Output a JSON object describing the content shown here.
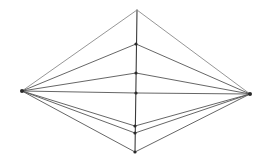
{
  "diagram": {
    "type": "perspective-construction",
    "vanishing_points": {
      "left": {
        "x": 22,
        "y": 91
      },
      "right": {
        "x": 250,
        "y": 94
      }
    },
    "vertical_line": {
      "points": [
        {
          "id": "top",
          "x": 137,
          "y": 10,
          "dot": false
        },
        {
          "id": "p2",
          "x": 136,
          "y": 44,
          "dot": true
        },
        {
          "id": "p3",
          "x": 136,
          "y": 73,
          "dot": true
        },
        {
          "id": "center",
          "x": 136,
          "y": 93,
          "dot": true
        },
        {
          "id": "p5",
          "x": 135,
          "y": 126,
          "dot": true
        },
        {
          "id": "p6",
          "x": 135,
          "y": 133,
          "dot": true
        },
        {
          "id": "bottom",
          "x": 135,
          "y": 152,
          "dot": true
        }
      ]
    },
    "colors": {
      "line": "#555555",
      "dot": "#2a2a2a",
      "background": "#ffffff"
    }
  }
}
